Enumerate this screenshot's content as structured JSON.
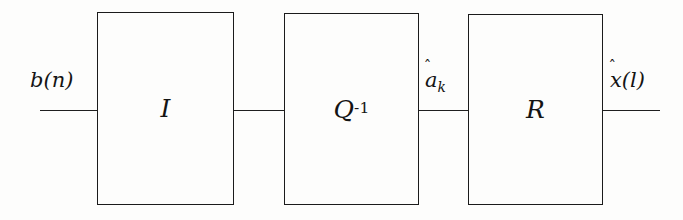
{
  "figure": {
    "type": "block-diagram",
    "background_color": "#fdfdfc",
    "line_color": "#1f1f1f"
  },
  "blocks": [
    {
      "id": "block-i",
      "label": "I",
      "superscript": "",
      "x": 97,
      "y": 12,
      "width": 137,
      "height": 193
    },
    {
      "id": "block-q-inv",
      "label": "Q",
      "superscript": "-1",
      "x": 284,
      "y": 13,
      "width": 135,
      "height": 192
    },
    {
      "id": "block-r",
      "label": "R",
      "superscript": "",
      "x": 468,
      "y": 14,
      "width": 135,
      "height": 191
    }
  ],
  "signals": [
    {
      "id": "signal-input",
      "base": "b",
      "hat": false,
      "suffix": "(n)",
      "subscript": "",
      "x": 30,
      "y": 70
    },
    {
      "id": "signal-a-hat-k",
      "base": "a",
      "hat": true,
      "suffix": "",
      "subscript": "k",
      "x": 425,
      "y": 70
    },
    {
      "id": "signal-x-hat-l",
      "base": "x",
      "hat": true,
      "suffix": "(l)",
      "subscript": "",
      "x": 610,
      "y": 70
    }
  ],
  "wires": [
    {
      "id": "wire-input-to-i",
      "x": 40,
      "y": 110,
      "length": 57
    },
    {
      "id": "wire-i-to-q",
      "x": 234,
      "y": 110,
      "length": 50
    },
    {
      "id": "wire-q-to-r",
      "x": 419,
      "y": 110,
      "length": 49
    },
    {
      "id": "wire-r-to-output",
      "x": 603,
      "y": 110,
      "length": 57
    }
  ]
}
